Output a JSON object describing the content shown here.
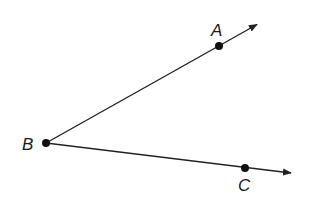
{
  "diagram": {
    "type": "angle",
    "title": "",
    "vertex": {
      "label": "B",
      "x": 46,
      "y": 143
    },
    "rays": [
      {
        "name": "ray-BA",
        "point": {
          "label": "A",
          "x": 219,
          "y": 46
        },
        "tip": {
          "x": 258,
          "y": 24
        }
      },
      {
        "name": "ray-BC",
        "point": {
          "label": "C",
          "x": 245,
          "y": 168
        },
        "tip": {
          "x": 292,
          "y": 173
        }
      }
    ],
    "line_color": "#222222",
    "point_color": "#111111"
  },
  "labels": {
    "A": "A",
    "B": "B",
    "C": "C"
  }
}
